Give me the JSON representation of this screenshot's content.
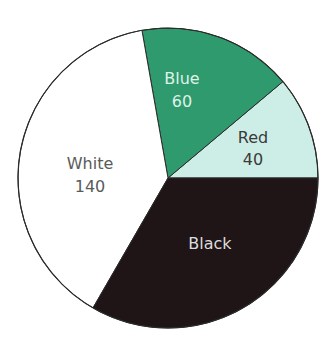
{
  "chart_data": {
    "type": "pie",
    "title": "",
    "total": 360,
    "start_angle_deg": 0,
    "direction": "counterclockwise-from-3-oclock-then-wrap",
    "center": [
      168,
      178
    ],
    "radius": 150,
    "outline_color": "#2b2b2b",
    "slices": [
      {
        "name": "Red",
        "label": "Red",
        "value": 40,
        "value_label": "40",
        "value_visible": true,
        "fill": "#cdeee6",
        "text_color": "#3a3a3a",
        "label_pos": [
          253,
          143
        ],
        "value_pos": [
          253,
          165
        ]
      },
      {
        "name": "Blue",
        "label": "Blue",
        "value": 60,
        "value_label": "60",
        "value_visible": true,
        "fill": "#2e9a6e",
        "text_color": "#dff3e8",
        "label_pos": [
          182,
          84
        ],
        "value_pos": [
          182,
          107
        ]
      },
      {
        "name": "White",
        "label": "White",
        "value": 140,
        "value_label": "140",
        "value_visible": true,
        "fill": "#ffffff",
        "text_color": "#5a5a5a",
        "label_pos": [
          90,
          169
        ],
        "value_pos": [
          90,
          192
        ]
      },
      {
        "name": "Black",
        "label": "Black",
        "value": 120,
        "value_label": "",
        "value_visible": false,
        "fill": "#1f1517",
        "text_color": "#dcdcdc",
        "label_pos": [
          210,
          249
        ],
        "value_pos": null
      }
    ],
    "legend": null,
    "grid": false
  }
}
